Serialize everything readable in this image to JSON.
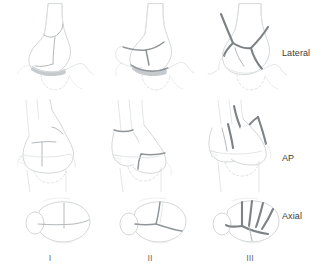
{
  "figure": {
    "view_labels": [
      "Lateral",
      "AP",
      "Axial"
    ],
    "type_labels": [
      "I",
      "II",
      "III"
    ],
    "label_color": "#3b3b3b",
    "outline_color": "#cfd2d4",
    "fracture_color": "#8f9599",
    "background": "#ffffff"
  },
  "rows": [
    {
      "id": "lateral",
      "label": "Lateral",
      "cells": [
        {
          "type": "I",
          "name": "lateral-type-1",
          "description": "undisplaced fracture lines"
        },
        {
          "type": "II",
          "name": "lateral-type-2",
          "description": "displaced transverse fracture"
        },
        {
          "type": "III",
          "name": "lateral-type-3",
          "description": "comminuted fracture"
        }
      ]
    },
    {
      "id": "ap",
      "label": "AP",
      "cells": [
        {
          "type": "I",
          "name": "ap-type-1",
          "description": "undisplaced fracture lines"
        },
        {
          "type": "II",
          "name": "ap-type-2",
          "description": "displaced fracture"
        },
        {
          "type": "III",
          "name": "ap-type-3",
          "description": "comminuted fracture"
        }
      ]
    },
    {
      "id": "axial",
      "label": "Axial",
      "cells": [
        {
          "type": "I",
          "name": "axial-type-1",
          "description": "undisplaced fracture lines"
        },
        {
          "type": "II",
          "name": "axial-type-2",
          "description": "displaced fragments"
        },
        {
          "type": "III",
          "name": "axial-type-3",
          "description": "multiple radiating fragments"
        }
      ]
    }
  ]
}
